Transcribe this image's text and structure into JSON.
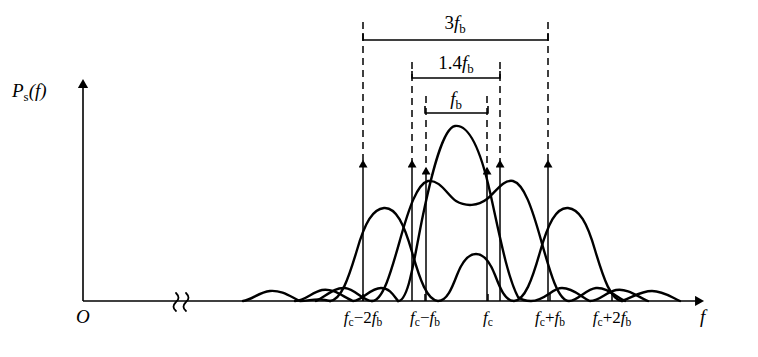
{
  "figure": {
    "type": "line",
    "kind": "power-spectral-density",
    "background_color": "#ffffff",
    "stroke_color": "#000000",
    "axis": {
      "y_label": "P_s(f)",
      "y_label_parts": {
        "main": "P",
        "sub": "s",
        "arg": "(f)"
      },
      "x_label": "f",
      "origin_label": "O",
      "has_break_symbol": true,
      "break_glyph": "break-squiggle",
      "baseline_y": 301,
      "y_axis_x": 83,
      "y_axis_top": 80,
      "x_axis_end": 700
    },
    "ticks": [
      {
        "label": "f_c-2f_b",
        "main": "f",
        "sub": "c",
        "op": "−2",
        "main2": "f",
        "sub2": "b",
        "x": 363
      },
      {
        "label": "f_c-f_b",
        "main": "f",
        "sub": "c",
        "op": "−",
        "main2": "f",
        "sub2": "b",
        "x": 425
      },
      {
        "label": "f_c",
        "main": "f",
        "sub": "c",
        "op": "",
        "main2": "",
        "sub2": "",
        "x": 488
      },
      {
        "label": "f_c+f_b",
        "main": "f",
        "sub": "c",
        "op": "+",
        "main2": "f",
        "sub2": "b",
        "x": 550
      },
      {
        "label": "f_c+2f_b",
        "main": "f",
        "sub": "c",
        "op": "+2",
        "main2": "f",
        "sub2": "b",
        "x": 612
      }
    ],
    "brackets": [
      {
        "name": "bandwidth-3fb",
        "label": "3f_b",
        "coef": "3",
        "main": "f",
        "sub": "b",
        "x1": 363,
        "x2": 548,
        "y": 40
      },
      {
        "name": "bandwidth-14fb",
        "label": "1.4f_b",
        "coef": "1.4",
        "main": "f",
        "sub": "b",
        "x1": 412,
        "x2": 500,
        "y": 78
      },
      {
        "name": "bandwidth-fb",
        "label": "f_b",
        "coef": "",
        "main": "f",
        "sub": "b",
        "x1": 425,
        "x2": 488,
        "y": 113
      }
    ],
    "dashed_guides": [
      {
        "x": 363,
        "y_top": 22,
        "y_bottom": 163
      },
      {
        "x": 412,
        "y_top": 62,
        "y_bottom": 163
      },
      {
        "x": 426,
        "y_top": 96,
        "y_bottom": 170
      },
      {
        "x": 487,
        "y_top": 96,
        "y_bottom": 170
      },
      {
        "x": 500,
        "y_top": 62,
        "y_bottom": 163
      },
      {
        "x": 548,
        "y_top": 22,
        "y_bottom": 163
      }
    ],
    "impulses": [
      {
        "name": "impulse-fc-2fb",
        "x": 363,
        "top": 163
      },
      {
        "name": "impulse-left-14",
        "x": 412,
        "top": 163
      },
      {
        "name": "impulse-fc-fb",
        "x": 426,
        "top": 170
      },
      {
        "name": "impulse-fc+fb",
        "x": 487,
        "top": 170
      },
      {
        "name": "impulse-right-14",
        "x": 500,
        "top": 163
      },
      {
        "name": "impulse-fc+2fb",
        "x": 548,
        "top": 163
      }
    ],
    "curves": [
      {
        "name": "curve-msk-center-peak",
        "description": "single tall main lobe centered at fc"
      },
      {
        "name": "curve-double-hump",
        "description": "two humps flanking fc with shallow dip at center"
      },
      {
        "name": "curve-wide-sidelobes",
        "description": "broad lobes at fc+-2fb with low center lobe"
      }
    ]
  }
}
